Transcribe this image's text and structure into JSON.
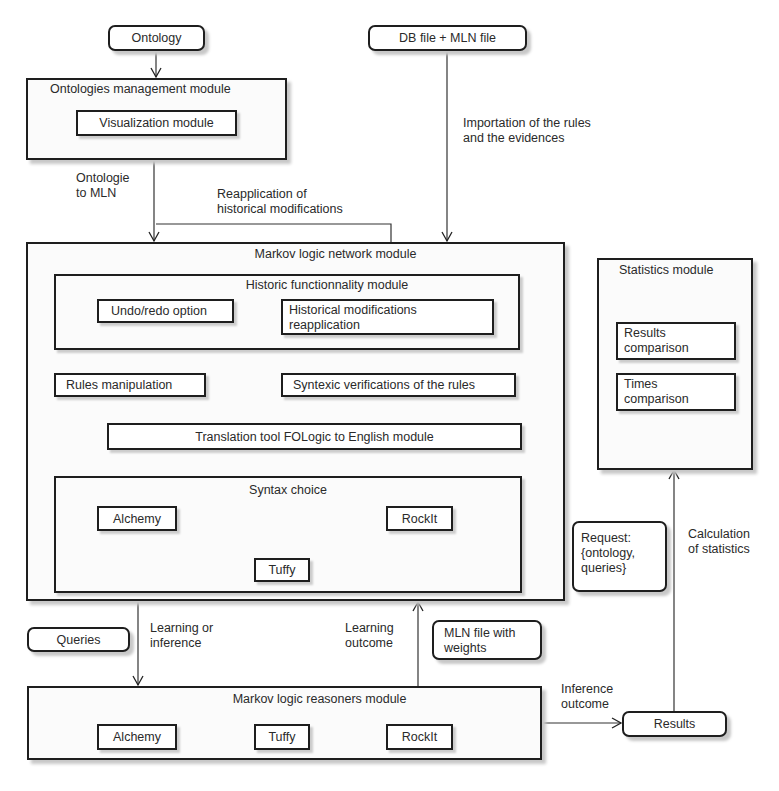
{
  "diagram": {
    "inputs": {
      "ontology": "Ontology",
      "db_mln_file": "DB file + MLN file",
      "queries": "Queries"
    },
    "ontologies_management": {
      "title": "Ontologies management module",
      "visualization": "Visualization module"
    },
    "mln_module": {
      "title": "Markov logic network module",
      "historic": {
        "title": "Historic functionnality module",
        "undo_redo": "Undo/redo option",
        "historical_reapplication_line1": "Historical modifications",
        "historical_reapplication_line2": "reapplication"
      },
      "rules_manipulation": "Rules manipulation",
      "syntexic_verifications": "Syntexic verifications of the rules",
      "translation_tool": "Translation tool FOLogic to English module",
      "syntax_choice": {
        "title": "Syntax choice",
        "alchemy": "Alchemy",
        "rockit": "RockIt",
        "tuffy": "Tuffy"
      }
    },
    "statistics_module": {
      "title": "Statistics module",
      "results_comparison_line1": "Results",
      "results_comparison_line2": "comparison",
      "times_comparison_line1": "Times",
      "times_comparison_line2": "comparison"
    },
    "request": {
      "line1": "Request:",
      "line2": "{ontology,",
      "line3": "queries}"
    },
    "mln_file_weights": {
      "line1": "MLN file with",
      "line2": "weights"
    },
    "reasoners_module": {
      "title": "Markov logic reasoners module",
      "alchemy": "Alchemy",
      "tuffy": "Tuffy",
      "rockit": "RockIt"
    },
    "results": "Results",
    "edge_labels": {
      "ontologie_to_mln_line1": "Ontologie",
      "ontologie_to_mln_line2": "to MLN",
      "reapplication_line1": "Reapplication of",
      "reapplication_line2": "historical modifications",
      "importation_line1": "Importation of the rules",
      "importation_line2": "and the evidences",
      "learning_or_inference_line1": "Learning or",
      "learning_or_inference_line2": "inference",
      "learning_outcome_line1": "Learning",
      "learning_outcome_line2": "outcome",
      "inference_outcome_line1": "Inference",
      "inference_outcome_line2": "outcome",
      "calculation_line1": "Calculation",
      "calculation_line2": "of statistics"
    }
  }
}
